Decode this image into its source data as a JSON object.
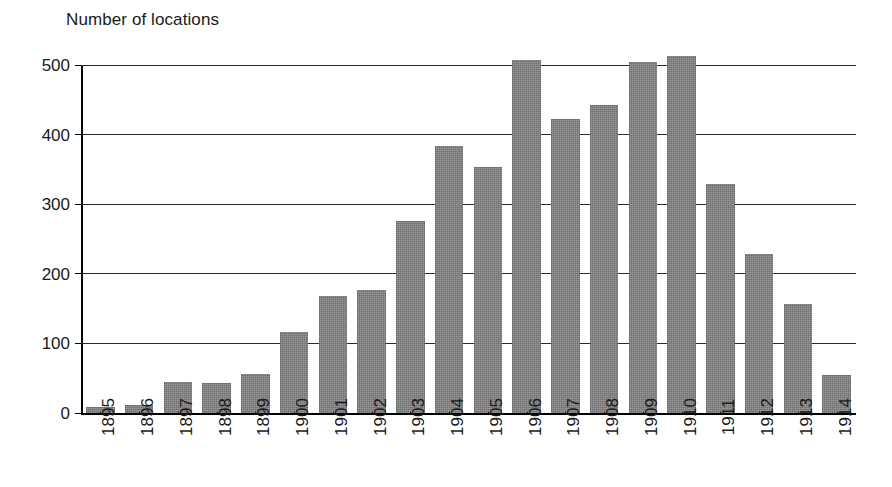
{
  "chart_data": {
    "type": "bar",
    "title": "Number of locations",
    "xlabel": "",
    "ylabel": "",
    "ylim": [
      0,
      500
    ],
    "yticks": [
      0,
      100,
      200,
      300,
      400,
      500
    ],
    "ytick_labels": [
      "0",
      "100",
      "200",
      "300",
      "400",
      "500"
    ],
    "grid": true,
    "legend": "none",
    "bar_color": "#7b7b7b",
    "axis_color": "#000000",
    "categories": [
      "1895",
      "1896",
      "1897",
      "1898",
      "1899",
      "1900",
      "1901",
      "1902",
      "1903",
      "1904",
      "1905",
      "1906",
      "1907",
      "1908",
      "1909",
      "1910",
      "1911",
      "1912",
      "1913",
      "1914"
    ],
    "values": [
      8,
      11,
      45,
      43,
      56,
      116,
      168,
      177,
      276,
      384,
      353,
      507,
      423,
      442,
      505,
      513,
      329,
      228,
      157,
      54
    ]
  }
}
